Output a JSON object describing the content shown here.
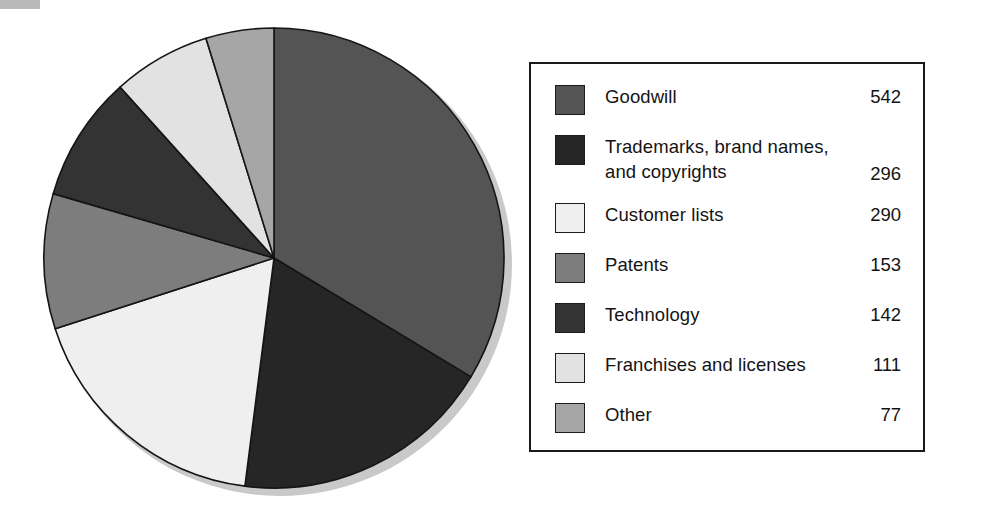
{
  "chart_data": {
    "type": "pie",
    "title": "",
    "subtitle": "",
    "xlabel": "",
    "ylabel": "",
    "legend_position": "right",
    "grid": false,
    "total": 1611,
    "units": "",
    "start_angle_deg": 0,
    "direction": "clockwise",
    "categories": [
      "Goodwill",
      "Trademarks, brand names,\nand copyrights",
      "Customer lists",
      "Patents",
      "Technology",
      "Franchises and licenses",
      "Other"
    ],
    "values": [
      542,
      296,
      290,
      153,
      142,
      111,
      77
    ],
    "colors": [
      "#545454",
      "#262626",
      "#efefef",
      "#7d7d7d",
      "#333333",
      "#e2e2e2",
      "#a6a6a6"
    ],
    "slices": [
      {
        "label": "Goodwill",
        "value": 542,
        "color": "#545454",
        "angle_deg": 121.1
      },
      {
        "label": "Trademarks, brand names,\nand copyrights",
        "value": 296,
        "color": "#262626",
        "angle_deg": 66.1
      },
      {
        "label": "Customer lists",
        "value": 290,
        "color": "#efefef",
        "angle_deg": 64.8
      },
      {
        "label": "Patents",
        "value": 153,
        "color": "#7d7d7d",
        "angle_deg": 34.2
      },
      {
        "label": "Technology",
        "value": 142,
        "color": "#333333",
        "angle_deg": 31.7
      },
      {
        "label": "Franchises and licenses",
        "value": 111,
        "color": "#e2e2e2",
        "angle_deg": 24.8
      },
      {
        "label": "Other",
        "value": 77,
        "color": "#a6a6a6",
        "angle_deg": 17.2
      }
    ]
  },
  "legend": {
    "rows": [
      {
        "label": "Goodwill",
        "value": "542",
        "color": "#545454"
      },
      {
        "label": "Trademarks, brand names,\nand copyrights",
        "value": "296",
        "color": "#262626"
      },
      {
        "label": "Customer lists",
        "value": "290",
        "color": "#efefef"
      },
      {
        "label": "Patents",
        "value": "153",
        "color": "#7d7d7d"
      },
      {
        "label": "Technology",
        "value": "142",
        "color": "#333333"
      },
      {
        "label": "Franchises and licenses",
        "value": "111",
        "color": "#e2e2e2"
      },
      {
        "label": "Other",
        "value": "77",
        "color": "#a6a6a6"
      }
    ]
  },
  "style": {
    "pie_outline": "#151515",
    "pie_shadow": "#c9c9c9",
    "legend_border": "#1a1a1a",
    "background": "#ffffff",
    "text": "#141414"
  }
}
